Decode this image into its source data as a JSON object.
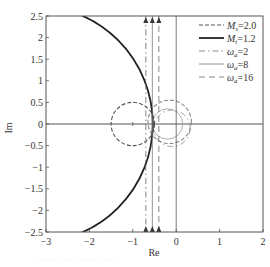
{
  "chart_data": {
    "type": "line",
    "title": "",
    "xlabel": "Re",
    "ylabel": "Im",
    "xlim": [
      -3,
      2
    ],
    "ylim": [
      -2.5,
      2.5
    ],
    "xticks": [
      -3,
      -2,
      -1,
      0,
      1,
      2
    ],
    "yticks": [
      -2.5,
      -2,
      -1.5,
      -1,
      -0.5,
      0,
      0.5,
      1,
      1.5,
      2,
      2.5
    ],
    "xtick_labels": [
      "−3",
      "−2",
      "−1",
      "0",
      "1",
      "2"
    ],
    "ytick_labels": [
      "−2.5",
      "−2",
      "−1.5",
      "−1",
      "−0.5",
      "0",
      "0.5",
      "1",
      "1.5",
      "2",
      "2.5"
    ],
    "grid": false,
    "legend_position": "upper right",
    "series": [
      {
        "name": "Ms=2.0",
        "legend_main": "M",
        "legend_sub": "s",
        "legend_value": "=2.0",
        "style": "dashed",
        "shape": "circle",
        "center": [
          -1.0,
          0
        ],
        "radius": 0.5,
        "color": "#555555"
      },
      {
        "name": "Mt=1.2",
        "legend_main": "M",
        "legend_sub": "t",
        "legend_value": "=1.2",
        "style": "solid-thick",
        "shape": "circle",
        "center": [
          -3.27,
          0
        ],
        "radius": 2.73,
        "color": "#222222"
      },
      {
        "name": "ωa=2",
        "legend_main": "ω",
        "legend_sub": "a",
        "legend_value": "=2",
        "style": "dash-dot",
        "shape": "vertical-line",
        "x": -0.7,
        "color": "#777777"
      },
      {
        "name": "ωa=8",
        "legend_main": "ω",
        "legend_sub": "a",
        "legend_value": "=8",
        "style": "solid-thin",
        "shape": "vertical-line",
        "x": -0.55,
        "color": "#777777"
      },
      {
        "name": "ωa=16",
        "legend_main": "ω",
        "legend_sub": "a",
        "legend_value": "=16",
        "style": "long-dash",
        "shape": "vertical-line",
        "x": -0.4,
        "color": "#777777"
      }
    ],
    "extra_shapes": [
      {
        "shape": "circle",
        "style": "dashed",
        "center": [
          -0.15,
          0.05
        ],
        "radius": 0.5,
        "color": "#888888"
      },
      {
        "shape": "circle",
        "style": "thin",
        "center": [
          -0.2,
          0
        ],
        "radius": 0.35,
        "color": "#999999"
      },
      {
        "shape": "circle",
        "style": "dash-dot",
        "center": [
          -0.1,
          -0.1
        ],
        "radius": 0.42,
        "color": "#999999"
      },
      {
        "shape": "vertical-line",
        "style": "solid-thin",
        "x": 0,
        "color": "#555555"
      }
    ],
    "annotations": [
      {
        "type": "arrow-markers",
        "positions_x": [
          -0.7,
          -0.55,
          -0.4
        ],
        "at": "top"
      },
      {
        "type": "arrow-markers",
        "positions_x": [
          -0.7,
          -0.55,
          -0.4
        ],
        "at": "bottom"
      }
    ]
  },
  "caption": "· · · · · · · · · · · · · · · · · ·"
}
